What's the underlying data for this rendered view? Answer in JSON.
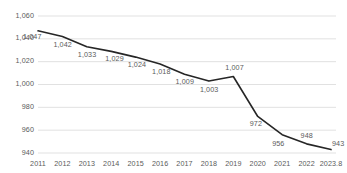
{
  "chart_data": {
    "type": "line",
    "title": "",
    "xlabel": "",
    "ylabel": "",
    "categories": [
      "2011",
      "2012",
      "2013",
      "2014",
      "2015",
      "2016",
      "2017",
      "2018",
      "2019",
      "2020",
      "2021",
      "2022",
      "2023.8"
    ],
    "values": [
      1047,
      1042,
      1033,
      1029,
      1024,
      1018,
      1009,
      1003,
      1007,
      972,
      956,
      948,
      943
    ],
    "point_labels": [
      "1,047",
      "1,042",
      "1,033",
      "1,029",
      "1,024",
      "1,018",
      "1,009",
      "1,003",
      "1,007",
      "972",
      "956",
      "948",
      "943"
    ],
    "ylim": [
      940,
      1060
    ],
    "y_ticks": [
      1060,
      1040,
      1020,
      1000,
      980,
      960,
      940
    ],
    "y_tick_labels": [
      "1,060",
      "1,040",
      "1,020",
      "1,000",
      "980",
      "960",
      "940"
    ],
    "grid": true,
    "legend": null,
    "series_color": "#262626",
    "grid_color": "#d9d9d9",
    "label_color": "#5a5a5a"
  }
}
